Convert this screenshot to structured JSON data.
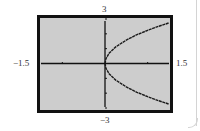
{
  "chart_data": {
    "type": "line",
    "title": "",
    "xlabel": "",
    "ylabel": "",
    "xlim": [
      -1.5,
      1.5
    ],
    "ylim": [
      -3,
      3
    ],
    "xscale_ticks": [
      -1,
      1
    ],
    "yscale_ticks": [
      -2,
      -1,
      1,
      2
    ],
    "grid": false,
    "legend": null,
    "window_labels": {
      "xmin": "−1.5",
      "xmax": "1.5",
      "ymin": "−3",
      "ymax": "3"
    },
    "series": [
      {
        "name": "upper branch",
        "x": [
          0,
          0.02,
          0.1,
          0.25,
          0.5,
          0.75,
          1.0,
          1.25,
          1.5
        ],
        "y": [
          0,
          0.32,
          0.71,
          1.12,
          1.58,
          1.94,
          2.24,
          2.5,
          2.74
        ]
      },
      {
        "name": "lower branch",
        "x": [
          0,
          0.02,
          0.1,
          0.25,
          0.5,
          0.75,
          1.0,
          1.25,
          1.5
        ],
        "y": [
          0,
          -0.32,
          -0.71,
          -1.12,
          -1.58,
          -1.94,
          -2.24,
          -2.5,
          -2.74
        ]
      }
    ],
    "colors": {
      "screen_fill": "#cdcdcd",
      "frame": "#111111",
      "curve": "#1a1a1a"
    }
  }
}
